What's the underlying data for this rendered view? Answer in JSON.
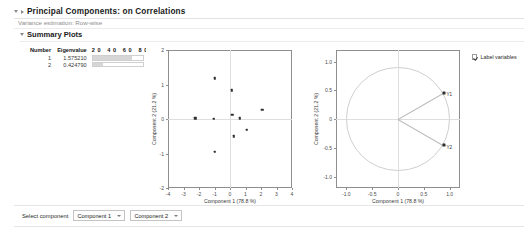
{
  "report": {
    "title": "Principal Components: on Correlations",
    "subtitle": "Variance estimation: Row-wise",
    "section_title": "Summary Plots"
  },
  "eigen_table": {
    "headers": [
      "Number",
      "Eigenvalue",
      "20 40 60 80"
    ],
    "axis_ticks": [
      "20",
      "40",
      "60",
      "80"
    ],
    "rows": [
      {
        "number": "1",
        "eigenvalue": "1.575210",
        "percent": 78.8
      },
      {
        "number": "2",
        "eigenvalue": "0.424790",
        "percent": 21.2
      }
    ]
  },
  "options": {
    "label_variables_label": "Label variables",
    "label_variables_checked": true
  },
  "bottom_bar": {
    "label": "Select component",
    "component_x": "Component 1",
    "component_y": "Component 2"
  },
  "chart_data": [
    {
      "type": "scatter",
      "name": "score-plot",
      "title": "",
      "xlabel": "Component 1 (78.8 %)",
      "ylabel": "Component 2 (21.2 %)",
      "xlim": [
        -4,
        4
      ],
      "ylim": [
        -2,
        2
      ],
      "xticks": [
        -4,
        -3,
        -2,
        -1,
        0,
        1,
        2,
        3,
        4
      ],
      "yticks": [
        -2,
        -1,
        0,
        1,
        2
      ],
      "xticklabels": [
        "-4",
        "-3",
        "-2",
        "-1",
        "0",
        "1",
        "2",
        "3",
        "4"
      ],
      "yticklabels": [
        "-2",
        "-1",
        "0",
        "1",
        "2"
      ],
      "grid": false,
      "reference_lines": {
        "x": 0,
        "y": 0
      },
      "points": [
        {
          "x": -2.25,
          "y": 0.02
        },
        {
          "x": -1.05,
          "y": 0.0
        },
        {
          "x": -1.0,
          "y": 1.18
        },
        {
          "x": -0.97,
          "y": -0.95
        },
        {
          "x": 0.13,
          "y": 0.83
        },
        {
          "x": 0.16,
          "y": 0.12
        },
        {
          "x": 0.25,
          "y": -0.5
        },
        {
          "x": 0.62,
          "y": 0.02
        },
        {
          "x": 1.08,
          "y": -0.32
        },
        {
          "x": 2.08,
          "y": 0.26
        }
      ]
    },
    {
      "type": "scatter",
      "name": "loading-plot",
      "title": "",
      "xlabel": "Component 1 (78.8 %)",
      "ylabel": "Component 2 (21.2 %)",
      "xlim": [
        -1.2,
        1.2
      ],
      "ylim": [
        -1.2,
        1.2
      ],
      "xticks": [
        -1.0,
        -0.5,
        0,
        0.5,
        1.0
      ],
      "yticks": [
        -1.0,
        -0.5,
        0,
        0.5,
        1.0
      ],
      "xticklabels": [
        "-1.0",
        "-0.5",
        "0",
        "0.5",
        "1.0"
      ],
      "yticklabels": [
        "-1.0",
        "-0.5",
        "0",
        "0.5",
        "1.0"
      ],
      "grid": false,
      "unit_circle": true,
      "reference_lines": {
        "x": 0,
        "y": 0
      },
      "loadings": [
        {
          "label": "Y1",
          "x": 0.888,
          "y": 0.46
        },
        {
          "label": "Y2",
          "x": 0.888,
          "y": -0.46
        }
      ]
    }
  ]
}
